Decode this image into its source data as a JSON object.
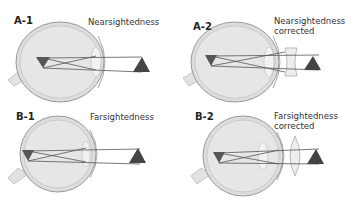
{
  "panels": [
    {
      "id": "A-1",
      "label": "A-1",
      "caption_line1": "Nearsightedness",
      "caption_line2": ""
    },
    {
      "id": "A-2",
      "label": "A-2",
      "caption_line1": "Nearsightedness",
      "caption_line2": "corrected"
    },
    {
      "id": "B-1",
      "label": "B-1",
      "caption_line1": "Farsightedness",
      "caption_line2": ""
    },
    {
      "id": "B-2",
      "label": "B-2",
      "caption_line1": "Farsightedness",
      "caption_line2": "corrected"
    }
  ],
  "colors": {
    "object": "#4a4a4a",
    "image": "#555555",
    "eye": "#d8d8d8",
    "outline": "#999999",
    "ray": "#555555"
  }
}
